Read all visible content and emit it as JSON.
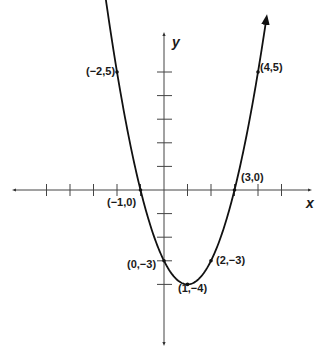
{
  "chart_data": {
    "type": "line",
    "title": "",
    "function": "y = x^2 - 2x - 3",
    "xlabel": "x",
    "ylabel": "y",
    "xlim": [
      -6.2,
      6.8
    ],
    "ylim": [
      -6.5,
      6.5
    ],
    "grid": false,
    "legend": null,
    "x_ticks": [
      -5,
      -4,
      -3,
      -2,
      -1,
      1,
      2,
      3,
      4,
      5
    ],
    "y_ticks": [
      -4,
      -3,
      -2,
      -1,
      1,
      2,
      3,
      4,
      5
    ],
    "series": [
      {
        "name": "parabola",
        "x": [
          -2.5,
          -2,
          -1,
          0,
          1,
          2,
          3,
          4,
          4.3
        ],
        "y": [
          8.25,
          5,
          0,
          -3,
          -4,
          -3,
          0,
          5,
          6.89
        ]
      }
    ],
    "labeled_points": [
      {
        "x": -2,
        "y": 5,
        "label": "(−2,5)"
      },
      {
        "x": 4,
        "y": 5,
        "label": "(4,5)"
      },
      {
        "x": -1,
        "y": 0,
        "label": "(−1,0)"
      },
      {
        "x": 3,
        "y": 0,
        "label": "(3,0)"
      },
      {
        "x": 0,
        "y": -3,
        "label": "(0,−3)"
      },
      {
        "x": 2,
        "y": -3,
        "label": "(2,−3)"
      },
      {
        "x": 1,
        "y": -4,
        "label": "(1,−4)"
      }
    ]
  },
  "labels": {
    "x_axis": "x",
    "y_axis": "y",
    "p_m2_5": "(−2,5)",
    "p_4_5": "(4,5)",
    "p_m1_0": "(−1,0)",
    "p_3_0": "(3,0)",
    "p_0_m3": "(0,−3)",
    "p_2_m3": "(2,−3)",
    "p_1_m4": "(1,−4)"
  },
  "colors": {
    "curve": "#111111",
    "axis": "#333333"
  }
}
